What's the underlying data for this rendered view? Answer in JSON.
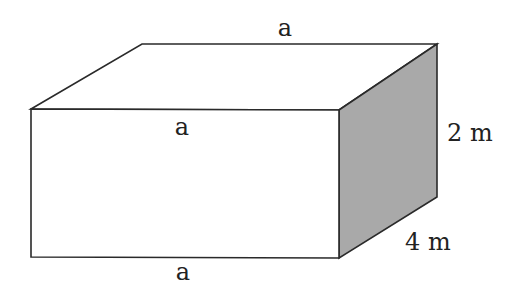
{
  "diagram": {
    "type": "rectangular-prism",
    "colors": {
      "edge": "#2a2a2a",
      "front_face": "#ffffff",
      "top_face": "#ffffff",
      "side_face": "#a9a9a9"
    },
    "labels": {
      "top_back_edge": "a",
      "front_top_edge": "a",
      "front_bottom_edge": "a",
      "height": "2 m",
      "depth": "4 m"
    }
  }
}
